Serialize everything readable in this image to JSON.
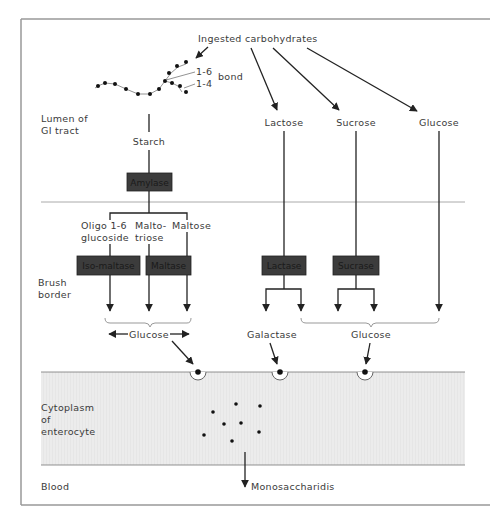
{
  "diagram": {
    "title_source": "Ingested carbohydrates",
    "bond_labels": {
      "bond_a": "1-6",
      "bond_b": "1-4",
      "bond_word": "bond"
    },
    "regions": {
      "lumen": [
        "Lumen of",
        "GI tract"
      ],
      "brush_border": [
        "Brush",
        "border"
      ],
      "cytoplasm": [
        "Cytoplasm",
        "of",
        "enterocyte"
      ],
      "blood": "Blood"
    },
    "lumen_substrates": {
      "starch": "Starch",
      "lactose": "Lactose",
      "sucrose": "Sucrose",
      "glucose": "Glucose"
    },
    "enzymes": {
      "amylase": "Amylase",
      "isomaltase": "Iso-maltase",
      "maltase": "Maltase",
      "lactase": "Lactase",
      "sucrase": "Sucrase"
    },
    "starch_products": {
      "oligo_line1": "Oligo 1-6",
      "oligo_line2": "glucoside",
      "maltotriose_line1": "Malto-",
      "maltotriose_line2": "triose",
      "maltose": "Maltose"
    },
    "brush_products": {
      "glucose_left": "Glucose",
      "galactose": "Galactase",
      "glucose_right": "Glucose"
    },
    "blood_output": "Monosaccharidis",
    "colors": {
      "enzyme_box": "#3c3c3c",
      "cytoplasm_fill": "#ececec",
      "line": "#222222",
      "frame": "#999999"
    }
  }
}
